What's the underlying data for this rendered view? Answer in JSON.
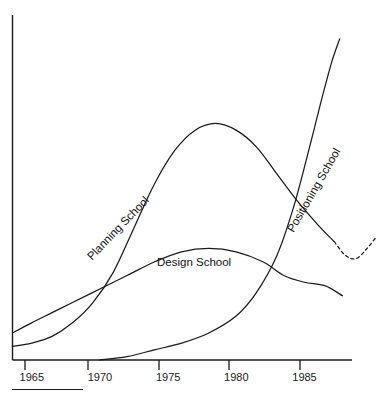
{
  "chart_data": {
    "type": "line",
    "title": "",
    "subtitle": "",
    "xlabel": "",
    "ylabel": "",
    "xlim": [
      1963.6,
      1988.5
    ],
    "ylim": [
      0,
      100
    ],
    "grid": false,
    "legend_position": "inline-curve-labels",
    "xticks": [
      1965,
      1970,
      1975,
      1980,
      1985
    ],
    "xtick_labels": [
      "1965",
      "1970",
      "1975",
      "1980",
      "1985"
    ],
    "yticks": [],
    "ytick_labels": [],
    "annotations": [
      {
        "text": "Planning School",
        "rotation": -46,
        "x": 1965.8,
        "y": 31
      },
      {
        "text": "Design School",
        "rotation": 0,
        "x": 1973.5,
        "y": 30
      },
      {
        "text": "Positioning School",
        "rotation": -60,
        "x": 1983.4,
        "y": 39
      }
    ],
    "series": [
      {
        "name": "Design School",
        "style": "solid",
        "points": [
          [
            1963.6,
            8
          ],
          [
            1965.0,
            11
          ],
          [
            1966.5,
            14
          ],
          [
            1968.0,
            17
          ],
          [
            1970.0,
            21
          ],
          [
            1972.0,
            25
          ],
          [
            1974.0,
            29
          ],
          [
            1976.0,
            32
          ],
          [
            1978.0,
            33
          ],
          [
            1980.0,
            32
          ],
          [
            1982.0,
            29
          ],
          [
            1983.5,
            25
          ],
          [
            1985.0,
            23
          ],
          [
            1986.5,
            22
          ],
          [
            1987.8,
            19
          ]
        ]
      },
      {
        "name": "Planning School",
        "style": "solid",
        "points": [
          [
            1963.6,
            4
          ],
          [
            1965.0,
            5
          ],
          [
            1966.5,
            7
          ],
          [
            1968.0,
            11
          ],
          [
            1969.5,
            17
          ],
          [
            1971.0,
            26
          ],
          [
            1972.5,
            39
          ],
          [
            1974.0,
            52
          ],
          [
            1975.5,
            62
          ],
          [
            1977.0,
            68
          ],
          [
            1978.5,
            70
          ],
          [
            1980.0,
            68
          ],
          [
            1981.5,
            63
          ],
          [
            1983.0,
            55
          ],
          [
            1984.5,
            47
          ],
          [
            1986.0,
            40
          ],
          [
            1987.2,
            35
          ]
        ]
      },
      {
        "name": "Planning School (projected)",
        "style": "dashed",
        "points": [
          [
            1987.2,
            35
          ],
          [
            1988.0,
            31
          ],
          [
            1988.8,
            30
          ],
          [
            1989.6,
            33
          ],
          [
            1990.2,
            36
          ]
        ]
      },
      {
        "name": "Positioning School",
        "style": "solid",
        "points": [
          [
            1970.0,
            0
          ],
          [
            1972.0,
            1
          ],
          [
            1974.0,
            3
          ],
          [
            1976.0,
            5
          ],
          [
            1978.0,
            8
          ],
          [
            1980.0,
            13
          ],
          [
            1981.5,
            20
          ],
          [
            1983.0,
            31
          ],
          [
            1984.2,
            45
          ],
          [
            1985.2,
            60
          ],
          [
            1986.2,
            76
          ],
          [
            1987.0,
            88
          ],
          [
            1987.6,
            95
          ]
        ]
      }
    ]
  },
  "axis": {
    "x_axis_name": "year-axis",
    "y_axis_name": "value-axis"
  },
  "footer": {
    "rule_name": "footnote-rule"
  }
}
